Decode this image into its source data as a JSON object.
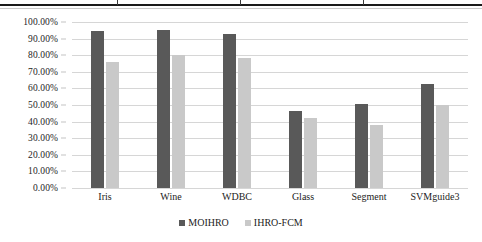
{
  "table_fragment": {
    "vrule_positions_px": [
      117,
      240,
      363
    ]
  },
  "chart_data": {
    "type": "bar",
    "title": "",
    "subtitle": "",
    "xlabel": "",
    "ylabel": "",
    "categories": [
      "Iris",
      "Wine",
      "WDBC",
      "Glass",
      "Segment",
      "SVMguide3"
    ],
    "series": [
      {
        "name": "MOIHRO",
        "color": "#595959",
        "values": [
          94.5,
          95.0,
          93.0,
          46.5,
          50.5,
          62.5
        ]
      },
      {
        "name": "IHRO-FCM",
        "color": "#c9c9c9",
        "values": [
          76.0,
          80.0,
          78.5,
          42.0,
          38.0,
          50.0
        ]
      }
    ],
    "ylim": [
      0,
      100
    ],
    "ytick_values": [
      100,
      90,
      80,
      70,
      60,
      50,
      40,
      30,
      20,
      10,
      0
    ],
    "ytick_labels": [
      "100.00%",
      "90.00%",
      "80.00%",
      "70.00%",
      "60.00%",
      "50.00%",
      "40.00%",
      "30.00%",
      "20.00%",
      "10.00%",
      "0.00%"
    ],
    "grid": true,
    "grid_axis": "y",
    "grid_color": "#d6d6d6",
    "legend_position": "bottom",
    "legend_entries": [
      "MOIHRO",
      "IHRO-FCM"
    ],
    "background": "#ffffff"
  }
}
